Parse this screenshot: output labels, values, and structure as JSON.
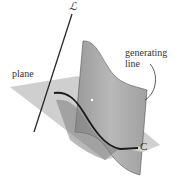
{
  "labels": {
    "line_symbol": "ℒ",
    "plane": "plane",
    "generating_line_1": "generating",
    "generating_line_2": "line",
    "curve": "C"
  },
  "colors": {
    "plane": "#c8c8c8",
    "surface": "#a9a9a9",
    "surface_dark": "#8a8a8a",
    "curve": "#1a1a1a",
    "line": "#2a2a2a"
  }
}
